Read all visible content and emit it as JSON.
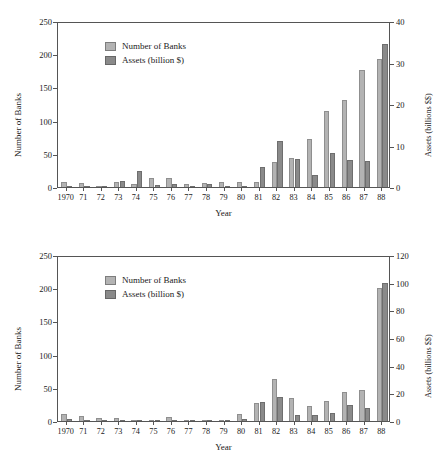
{
  "figure": {
    "legend": {
      "series1_label": "Number of Banks",
      "series2_label": "Assets (billion $)",
      "series1_color": "#b3b3b3",
      "series2_color": "#8a8a8a"
    },
    "axis_titles": {
      "x": "Year",
      "y_left": "Number of Banks",
      "y_right": "Assets (billions $$)"
    }
  },
  "chart_data": [
    {
      "type": "bar",
      "id": "top",
      "title": "",
      "xlabel": "Year",
      "ylabel": "Number of Banks",
      "y2label": "Assets (billions $$)",
      "ylim": [
        0,
        250
      ],
      "y2lim": [
        0,
        40
      ],
      "yticks": [
        "0",
        "50",
        "100",
        "150",
        "200",
        "250"
      ],
      "ytick_values": [
        0,
        50,
        100,
        150,
        200,
        250
      ],
      "y2ticks": [
        "0",
        "10",
        "20",
        "30",
        "40"
      ],
      "y2tick_values": [
        0,
        10,
        20,
        30,
        40
      ],
      "grid": false,
      "legend_position": "upper-left-inside",
      "categories": [
        "1970",
        "71",
        "72",
        "73",
        "74",
        "75",
        "76",
        "77",
        "78",
        "79",
        "80",
        "81",
        "82",
        "83",
        "84",
        "85",
        "86",
        "87",
        "88"
      ],
      "series": [
        {
          "name": "Number of Banks",
          "axis": "left",
          "values": [
            8,
            6,
            1,
            7,
            4,
            13,
            14,
            5,
            6,
            8,
            8,
            8,
            38,
            44,
            73,
            114,
            131,
            176,
            193
          ]
        },
        {
          "name": "Assets (billion $)",
          "axis": "right",
          "values": [
            0.1,
            0.2,
            0.05,
            1.4,
            3.8,
            0.4,
            0.8,
            0.2,
            0.8,
            0.1,
            0.2,
            4.8,
            11.0,
            6.7,
            2.9,
            8.2,
            6.5,
            6.2,
            34.5
          ]
        }
      ]
    },
    {
      "type": "bar",
      "id": "bottom",
      "title": "",
      "xlabel": "Year",
      "ylabel": "Number of Banks",
      "y2label": "Assets (billions $$)",
      "ylim": [
        0,
        250
      ],
      "y2lim": [
        0,
        120
      ],
      "yticks": [
        "0",
        "50",
        "100",
        "150",
        "200",
        "250"
      ],
      "ytick_values": [
        0,
        50,
        100,
        150,
        200,
        250
      ],
      "y2ticks": [
        "0",
        "20",
        "40",
        "60",
        "80",
        "100",
        "120"
      ],
      "y2tick_values": [
        0,
        20,
        40,
        60,
        80,
        100,
        120
      ],
      "grid": false,
      "legend_position": "upper-left-inside",
      "categories": [
        "1970",
        "71",
        "72",
        "73",
        "74",
        "75",
        "76",
        "77",
        "78",
        "79",
        "80",
        "81",
        "82",
        "83",
        "84",
        "85",
        "86",
        "87",
        "88"
      ],
      "series": [
        {
          "name": "Number of Banks",
          "axis": "left",
          "values": [
            11,
            7,
            4,
            5,
            2,
            2,
            6,
            2,
            2,
            2,
            11,
            27,
            63,
            35,
            22,
            30,
            44,
            47,
            201
          ]
        },
        {
          "name": "Assets (billion $)",
          "axis": "right",
          "values": [
            1.5,
            0.5,
            0.2,
            0.2,
            0.2,
            0.2,
            0.5,
            0.2,
            0.2,
            0.4,
            1.5,
            13.5,
            17.5,
            4.0,
            4.0,
            6.0,
            11.5,
            9.5,
            100.0
          ]
        }
      ]
    }
  ]
}
